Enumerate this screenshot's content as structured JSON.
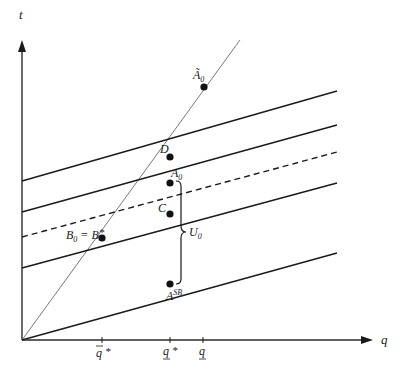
{
  "diagram": {
    "axes": {
      "y_label": "t",
      "x_label": "q"
    },
    "x_ticks": [
      {
        "id": "qbar_star",
        "label": "q̄*",
        "x": 102
      },
      {
        "id": "qunder_star",
        "label": "q*",
        "x": 170
      },
      {
        "id": "qunder",
        "label": "q",
        "x": 203
      }
    ],
    "points": [
      {
        "id": "A0_tilde",
        "label": "Ã",
        "sub": "0",
        "x": 204,
        "y": 87
      },
      {
        "id": "D",
        "label": "D",
        "sub": "",
        "x": 170,
        "y": 157
      },
      {
        "id": "A0",
        "label": "A",
        "sub": "0",
        "x": 170,
        "y": 183
      },
      {
        "id": "C",
        "label": "C",
        "sub": "",
        "x": 170,
        "y": 214
      },
      {
        "id": "B0",
        "label": "B",
        "sub": "0",
        "x": 102,
        "y": 238
      },
      {
        "id": "ASB",
        "label": "A",
        "sup": "SB",
        "x": 170,
        "y": 284
      }
    ],
    "labels": {
      "b0_eq": "= B",
      "b0_star": "*",
      "brace_label": "U",
      "brace_sub": "0"
    },
    "lines": [
      {
        "id": "line-1",
        "style": "solid",
        "y_start": 181,
        "y_end": 91
      },
      {
        "id": "line-2",
        "style": "solid",
        "y_start": 212,
        "y_end": 125
      },
      {
        "id": "line-3",
        "style": "dashed",
        "y_start": 237,
        "y_end": 152
      },
      {
        "id": "line-4",
        "style": "solid",
        "y_start": 268,
        "y_end": 183
      },
      {
        "id": "line-5",
        "style": "solid",
        "y_start": 340,
        "y_end": 253
      }
    ]
  }
}
